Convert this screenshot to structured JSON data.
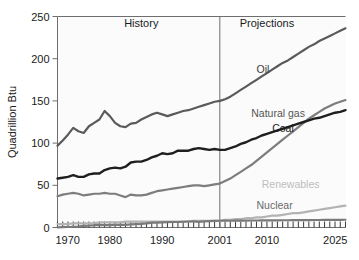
{
  "chart_data": {
    "type": "line",
    "title": "",
    "xlabel": "",
    "ylabel": "Quadrillion Btu",
    "xlim": [
      1970,
      2025
    ],
    "ylim": [
      0,
      250
    ],
    "grid": false,
    "legend_position": "inline-end-labels",
    "x_ticks": [
      1970,
      1980,
      1990,
      2001,
      2010,
      2025
    ],
    "x_tick_labels": [
      "1970",
      "1980",
      "1990",
      "2001",
      "2010",
      "2025"
    ],
    "y_ticks": [
      0,
      50,
      100,
      150,
      200,
      250
    ],
    "y_tick_labels": [
      "0",
      "50",
      "100",
      "150",
      "200",
      "250"
    ],
    "minor_tick_interval": 1,
    "annotations": [
      {
        "text": "History",
        "x": 1986,
        "y": 237
      },
      {
        "text": "Projections",
        "x": 2010,
        "y": 237
      }
    ],
    "divider": {
      "x": 2001,
      "label": "history-projection-divider"
    },
    "x": [
      1970,
      1971,
      1972,
      1973,
      1974,
      1975,
      1976,
      1977,
      1978,
      1979,
      1980,
      1981,
      1982,
      1983,
      1984,
      1985,
      1986,
      1987,
      1988,
      1989,
      1990,
      1991,
      1992,
      1993,
      1994,
      1995,
      1996,
      1997,
      1998,
      1999,
      2000,
      2001,
      2002,
      2003,
      2004,
      2005,
      2006,
      2007,
      2008,
      2009,
      2010,
      2011,
      2012,
      2013,
      2014,
      2015,
      2016,
      2017,
      2018,
      2019,
      2020,
      2021,
      2022,
      2023,
      2024,
      2025
    ],
    "series": [
      {
        "name": "Oil",
        "color": "#5a5a5a",
        "label_color": "#3a3a3a",
        "width": 2.2,
        "label_x": 2008,
        "label_y": 183,
        "values": [
          97,
          103,
          110,
          118,
          114,
          112,
          120,
          124,
          128,
          138,
          132,
          124,
          120,
          119,
          123,
          124,
          128,
          131,
          134,
          136,
          134,
          132,
          134,
          136,
          138,
          139,
          141,
          143,
          145,
          147,
          149,
          150,
          152,
          155,
          159,
          163,
          167,
          171,
          175,
          179,
          183,
          187,
          191,
          195,
          198,
          202,
          206,
          210,
          214,
          217,
          221,
          224,
          227,
          230,
          233,
          236
        ]
      },
      {
        "name": "Natural gas",
        "color": "#7d7d7d",
        "label_color": "#555555",
        "width": 2.2,
        "label_x": 2007,
        "label_y": 131,
        "values": [
          37,
          39,
          40,
          41,
          40,
          38,
          39,
          40,
          40,
          41,
          40,
          40,
          38,
          36,
          39,
          38,
          38,
          39,
          41,
          43,
          44,
          45,
          46,
          47,
          48,
          49,
          50,
          50,
          49,
          50,
          51,
          52,
          55,
          58,
          62,
          66,
          70,
          74,
          79,
          84,
          89,
          94,
          99,
          104,
          109,
          114,
          119,
          124,
          129,
          133,
          137,
          141,
          144,
          147,
          149,
          151
        ]
      },
      {
        "name": "Coal",
        "color": "#1f1f1f",
        "label_color": "#1a1a1a",
        "width": 2.4,
        "label_x": 2011,
        "label_y": 113,
        "values": [
          58,
          59,
          60,
          62,
          60,
          60,
          63,
          64,
          64,
          68,
          70,
          71,
          70,
          72,
          77,
          78,
          78,
          80,
          83,
          85,
          88,
          87,
          88,
          91,
          91,
          91,
          93,
          94,
          93,
          92,
          93,
          92,
          92,
          94,
          96,
          99,
          101,
          104,
          106,
          109,
          111,
          113,
          115,
          117,
          119,
          121,
          123,
          125,
          127,
          129,
          130,
          132,
          134,
          136,
          137,
          139
        ]
      },
      {
        "name": "Renewables",
        "color": "#b3b3b3",
        "label_color": "#bdbdbd",
        "width": 2.2,
        "label_x": 2009,
        "label_y": 47,
        "values": [
          4,
          4,
          4,
          5,
          5,
          5,
          5,
          5,
          6,
          6,
          6,
          6,
          6,
          7,
          7,
          7,
          7,
          7,
          7,
          7,
          7,
          7,
          7,
          7,
          7,
          7,
          8,
          8,
          8,
          8,
          8,
          8,
          9,
          9,
          10,
          10,
          11,
          11,
          12,
          12,
          13,
          14,
          14,
          15,
          16,
          17,
          17,
          18,
          19,
          20,
          21,
          22,
          23,
          24,
          25,
          26
        ]
      },
      {
        "name": "Nuclear",
        "color": "#7a7a7a",
        "label_color": "#6a6a6a",
        "width": 2.2,
        "label_x": 2008,
        "label_y": 22,
        "values": [
          0.2,
          0.4,
          0.6,
          0.9,
          1.2,
          1.9,
          2.1,
          2.7,
          3.0,
          2.8,
          2.7,
          3.0,
          3.1,
          3.2,
          3.6,
          4.1,
          4.4,
          4.9,
          5.7,
          5.7,
          6.1,
          6.4,
          6.5,
          6.5,
          6.8,
          7.1,
          7.2,
          6.7,
          7.2,
          7.6,
          7.9,
          8.0,
          8.1,
          8.0,
          8.2,
          8.2,
          8.2,
          8.3,
          8.3,
          8.4,
          8.4,
          8.5,
          8.5,
          8.6,
          8.6,
          8.7,
          8.7,
          8.8,
          8.8,
          8.9,
          8.9,
          9.0,
          9.0,
          9.1,
          9.1,
          9.2
        ]
      }
    ]
  }
}
